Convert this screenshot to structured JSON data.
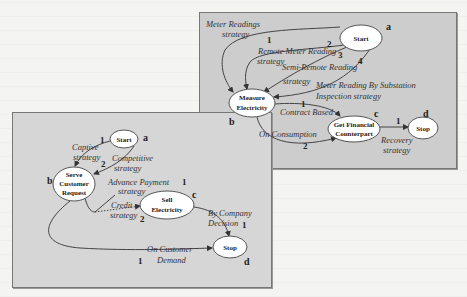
{
  "diagrams": {
    "top": {
      "nodes": {
        "start": {
          "label": "Start",
          "tag": "a"
        },
        "measure": {
          "label_line1": "Measure",
          "label_line2": "Electricity",
          "tag": "b"
        },
        "financial": {
          "label_line1": "Get Financial",
          "label_line2": "Counterpart",
          "tag": "c"
        },
        "stop": {
          "label": "Stop",
          "tag": "d"
        }
      },
      "edges": {
        "meter_readings": {
          "label_line1": "Meter Readings",
          "label_line2": "strategy",
          "num": "1"
        },
        "remote_meter": {
          "label_line1": "Remote Meter Reading",
          "label_line2": "strategy",
          "num": "2"
        },
        "semi_remote": {
          "label_line1": "Semi-Remote Reading",
          "label_line2": "strategy",
          "num": "3"
        },
        "substation": {
          "label_line1": "Meter Reading By Substation",
          "label_line2": "Inspection strategy",
          "num": "4"
        },
        "contract": {
          "label": "Contract Based",
          "num": "1"
        },
        "consumption": {
          "label": "On Consumption",
          "num": "2"
        },
        "recovery": {
          "label_line1": "Recovery",
          "label_line2": "strategy",
          "num": "1"
        }
      }
    },
    "bottom": {
      "nodes": {
        "start": {
          "label": "Start",
          "tag": "a"
        },
        "serve": {
          "label_line1": "Serve",
          "label_line2": "Customer",
          "label_line3": "Request",
          "tag": "b"
        },
        "sell": {
          "label_line1": "Sell",
          "label_line2": "Electricity",
          "tag": "c"
        },
        "stop": {
          "label": "Stop",
          "tag": "d"
        }
      },
      "edges": {
        "captive": {
          "label_line1": "Captive",
          "label_line2": "strategy",
          "num": "1"
        },
        "competitive": {
          "label_line1": "Competitive",
          "label_line2": "strategy",
          "num": "2"
        },
        "advance": {
          "label_line1": "Advance Payment",
          "label_line2": "strategy",
          "num": "1"
        },
        "credit": {
          "label_line1": "Credit",
          "label_line2": "strategy",
          "num": "2"
        },
        "company": {
          "label_line1": "By Company",
          "label_line2": "Decision",
          "num": "1"
        },
        "customer": {
          "label_line1": "On Customer",
          "label_line2": "Demand",
          "num": "1"
        }
      }
    }
  }
}
